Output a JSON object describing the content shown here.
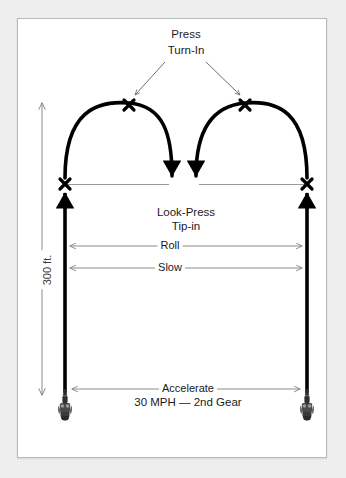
{
  "diagram": {
    "background_color": "#eeeeee",
    "frame_color": "#ffffff",
    "path_color": "#000000",
    "guide_color": "#8c8c8c",
    "labels": {
      "press": "Press",
      "turn_in": "Turn-In",
      "look_press": "Look-Press",
      "tip_in": "Tip-in",
      "roll": "Roll",
      "slow": "Slow",
      "accelerate": "Accelerate",
      "speed_gear": "30 MPH — 2nd Gear",
      "distance": "300 ft."
    },
    "markers": [
      {
        "name": "x-mark-left-entry",
        "x": 65,
        "y": 184
      },
      {
        "name": "x-mark-left-apex",
        "x": 129,
        "y": 105
      },
      {
        "name": "x-mark-right-apex",
        "x": 245,
        "y": 105
      },
      {
        "name": "x-mark-right-entry",
        "x": 307,
        "y": 184
      }
    ],
    "icons": [
      {
        "name": "motorcycle-icon-left",
        "x": 65,
        "y": 403
      },
      {
        "name": "motorcycle-icon-right",
        "x": 307,
        "y": 403
      }
    ]
  }
}
